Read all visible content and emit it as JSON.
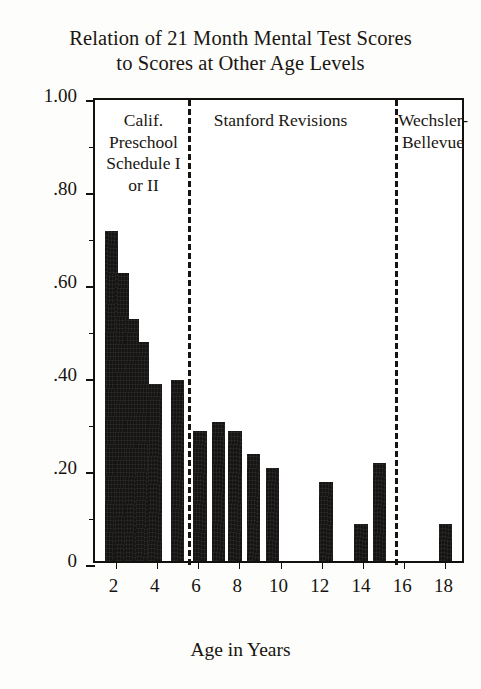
{
  "chart_data": {
    "type": "bar",
    "title": "Relation of 21 Month Mental Test Scores to Scores at Other Age Levels",
    "title_lines": [
      "Relation of 21 Month Mental Test Scores",
      "to Scores at Other Age Levels"
    ],
    "xlabel": "Age in Years",
    "ylabel": "Coefficients of Correlation",
    "ylim": [
      0,
      1.0
    ],
    "xlim": [
      1,
      19
    ],
    "grid": false,
    "legend": "none",
    "y_ticks_major": [
      {
        "value": 1.0,
        "label": "1.00"
      },
      {
        "value": 0.8,
        "label": ".80"
      },
      {
        "value": 0.6,
        "label": ".60"
      },
      {
        "value": 0.4,
        "label": ".40"
      },
      {
        "value": 0.2,
        "label": ".20"
      },
      {
        "value": 0.0,
        "label": "0"
      }
    ],
    "y_ticks_minor": [
      0.9,
      0.7,
      0.5,
      0.3,
      0.1
    ],
    "x_ticks": [
      {
        "value": 2,
        "label": "2"
      },
      {
        "value": 4,
        "label": "4"
      },
      {
        "value": 6,
        "label": "6"
      },
      {
        "value": 8,
        "label": "8"
      },
      {
        "value": 10,
        "label": "10"
      },
      {
        "value": 12,
        "label": "12"
      },
      {
        "value": 14,
        "label": "14"
      },
      {
        "value": 16,
        "label": "16"
      },
      {
        "value": 18,
        "label": "18"
      }
    ],
    "categories": [
      1.8,
      2.3,
      2.8,
      3.3,
      3.9,
      5.0,
      6.1,
      7.0,
      7.8,
      8.7,
      9.6,
      12.2,
      13.9,
      14.8,
      18.0
    ],
    "values": [
      0.71,
      0.62,
      0.52,
      0.47,
      0.38,
      0.39,
      0.28,
      0.3,
      0.28,
      0.23,
      0.2,
      0.17,
      0.08,
      0.21,
      0.08
    ],
    "bars": [
      {
        "x": 1.8,
        "value": 0.71
      },
      {
        "x": 2.3,
        "value": 0.62
      },
      {
        "x": 2.8,
        "value": 0.52
      },
      {
        "x": 3.3,
        "value": 0.47
      },
      {
        "x": 3.9,
        "value": 0.38
      },
      {
        "x": 5.0,
        "value": 0.39
      },
      {
        "x": 6.1,
        "value": 0.28
      },
      {
        "x": 7.0,
        "value": 0.3
      },
      {
        "x": 7.8,
        "value": 0.28
      },
      {
        "x": 8.7,
        "value": 0.23
      },
      {
        "x": 9.6,
        "value": 0.2
      },
      {
        "x": 12.2,
        "value": 0.17
      },
      {
        "x": 13.9,
        "value": 0.08
      },
      {
        "x": 14.8,
        "value": 0.21
      },
      {
        "x": 18.0,
        "value": 0.08
      }
    ],
    "dividers": [
      {
        "x": 5.52,
        "style": "dashed"
      },
      {
        "x": 15.55,
        "style": "dashed"
      }
    ],
    "sections": [
      {
        "name": "calif-preschool",
        "lines": [
          "Calif.",
          "Preschool",
          "Schedule I",
          "or II"
        ],
        "center_x": 3.35
      },
      {
        "name": "stanford-revisions",
        "lines": [
          "Stanford Revisions"
        ],
        "center_x": 10.0
      },
      {
        "name": "wechsler-bellevue",
        "lines": [
          "Wechsler-",
          "Bellevue"
        ],
        "center_x": 17.4
      }
    ],
    "colors": {
      "bar": "#161412",
      "axis": "#13110e",
      "text": "#17140f",
      "background": "#ffffff"
    }
  }
}
